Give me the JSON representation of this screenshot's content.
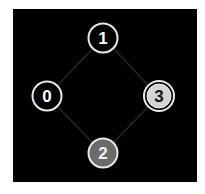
{
  "graph": {
    "background": "#000000",
    "edge_color": "#2a2a2a",
    "nodes": [
      {
        "id": "0",
        "label": "0",
        "cx": 47,
        "cy": 96,
        "fill": "#000000",
        "text_color": "#ffffff",
        "ring": "#e8e8e8",
        "double_ring": false
      },
      {
        "id": "1",
        "label": "1",
        "cx": 103,
        "cy": 38,
        "fill": "#000000",
        "text_color": "#ffffff",
        "ring": "#e8e8e8",
        "double_ring": false
      },
      {
        "id": "2",
        "label": "2",
        "cx": 103,
        "cy": 153,
        "fill": "#6b6b6b",
        "text_color": "#ffffff",
        "ring": "#e8e8e8",
        "double_ring": false
      },
      {
        "id": "3",
        "label": "3",
        "cx": 159,
        "cy": 96,
        "fill": "#d4d4d4",
        "text_color": "#111111",
        "ring": "#e8e8e8",
        "double_ring": true
      }
    ],
    "edges": [
      {
        "from": "0",
        "to": "1"
      },
      {
        "from": "1",
        "to": "3"
      },
      {
        "from": "3",
        "to": "2"
      },
      {
        "from": "2",
        "to": "0"
      }
    ]
  }
}
